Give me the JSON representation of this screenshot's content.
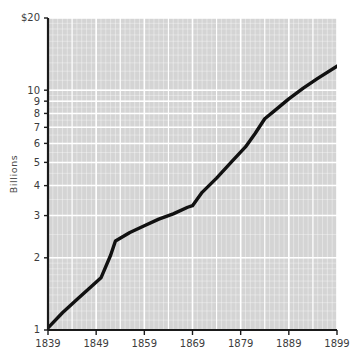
{
  "chart_data": {
    "type": "line",
    "title": "",
    "xlabel": "",
    "ylabel": "Billions",
    "y_scale": "log",
    "ylim": [
      1,
      20
    ],
    "xlim": [
      1839,
      1899
    ],
    "grid": true,
    "legend": false,
    "y_tick_labels": [
      "$20",
      "10",
      "9",
      "8",
      "7",
      "6",
      "5",
      "4",
      "3",
      "2",
      "1"
    ],
    "y_tick_values": [
      20,
      10,
      9,
      8,
      7,
      6,
      5,
      4,
      3,
      2,
      1
    ],
    "x_tick_labels": [
      "1839",
      "1849",
      "1859",
      "1869",
      "1879",
      "1889",
      "1899"
    ],
    "x_tick_values": [
      1839,
      1849,
      1859,
      1869,
      1879,
      1889,
      1899
    ],
    "series": [
      {
        "name": "value",
        "x": [
          1839,
          1842,
          1845,
          1848,
          1850,
          1852,
          1853,
          1856,
          1859,
          1862,
          1865,
          1868,
          1869,
          1871,
          1874,
          1877,
          1880,
          1882,
          1884,
          1886,
          1889,
          1892,
          1895,
          1899
        ],
        "values": [
          1.02,
          1.18,
          1.34,
          1.52,
          1.65,
          2.05,
          2.35,
          2.55,
          2.72,
          2.9,
          3.05,
          3.25,
          3.3,
          3.75,
          4.3,
          5.0,
          5.8,
          6.6,
          7.6,
          8.2,
          9.2,
          10.2,
          11.2,
          12.6
        ]
      }
    ],
    "colors": {
      "line": "#111111",
      "plot_background": "#d4d4d4",
      "grid_line": "#ffffff",
      "axis": "#1a1a1a",
      "text": "#3c3c3c",
      "page_background": "#ffffff"
    }
  }
}
